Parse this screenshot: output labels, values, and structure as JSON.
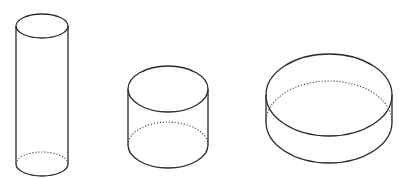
{
  "figure": {
    "stroke_color": "#2a2a2a",
    "background": "#ffffff",
    "cylinders": [
      {
        "name": "tall-narrow-cylinder",
        "cx": 42,
        "top_cy": 26,
        "bottom_cy": 164,
        "rx": 26,
        "ry": 12
      },
      {
        "name": "medium-cylinder",
        "cx": 168,
        "top_cy": 89,
        "bottom_cy": 145,
        "rx": 40,
        "ry": 23
      },
      {
        "name": "short-wide-cylinder",
        "cx": 329,
        "top_cy": 95,
        "bottom_cy": 122,
        "rx": 63,
        "ry": 41
      }
    ]
  }
}
